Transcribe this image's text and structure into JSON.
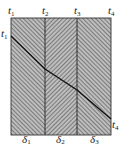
{
  "diagram": {
    "type": "composite-wall-temperature-profile",
    "temperature_labels_top": [
      {
        "name": "t",
        "sub": "1"
      },
      {
        "name": "t",
        "sub": "2"
      },
      {
        "name": "t",
        "sub": "3"
      },
      {
        "name": "t",
        "sub": "4"
      }
    ],
    "left_label": {
      "name": "t",
      "sub": "1"
    },
    "right_label": {
      "name": "t",
      "sub": "4"
    },
    "layer_labels": [
      {
        "name": "δ",
        "sub": "1"
      },
      {
        "name": "δ",
        "sub": "2"
      },
      {
        "name": "δ",
        "sub": "3"
      }
    ],
    "colors": {
      "border": "#333333",
      "hatch": "#777777",
      "profile": "#111111",
      "background": "#ffffff"
    }
  }
}
